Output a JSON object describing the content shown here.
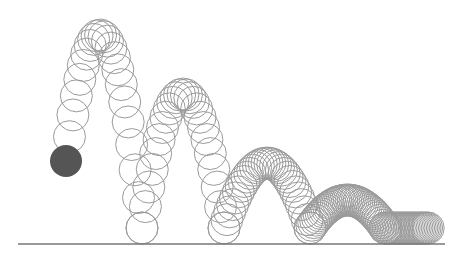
{
  "figure": {
    "title": "",
    "ball_color": "#555555",
    "ghost_color": "#9a9a9a",
    "ground_color": "#777777",
    "bounces": 4,
    "restitution": 0.72
  }
}
